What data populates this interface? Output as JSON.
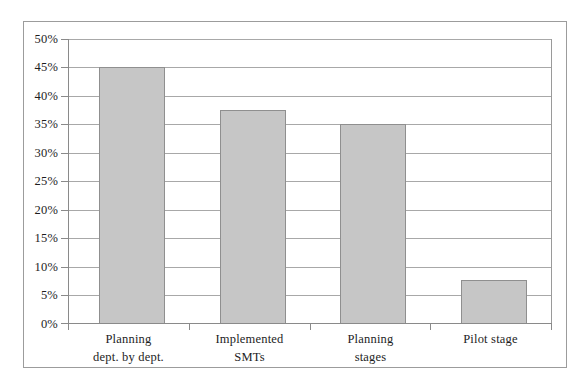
{
  "chart_data": {
    "type": "bar",
    "title": "",
    "subtitle": "",
    "xlabel": "",
    "ylabel": "",
    "categories": [
      "Planning dept. by dept.",
      "Implemented SMTs",
      "Planning stages",
      "Pilot stage"
    ],
    "category_lines": [
      [
        "Planning",
        "dept. by dept."
      ],
      [
        "Implemented",
        "SMTs"
      ],
      [
        "Planning",
        "stages"
      ],
      [
        "Pilot stage"
      ]
    ],
    "values": [
      45,
      37.5,
      35,
      7.5
    ],
    "value_labels": [
      "45%",
      "37.5%",
      "35%",
      "7.5%"
    ],
    "ylim": [
      0,
      50
    ],
    "ytick_step": 5,
    "ytick_labels": [
      "50%",
      "45%",
      "40%",
      "35%",
      "30%",
      "25%",
      "20%",
      "15%",
      "10%",
      "5%",
      "0%"
    ],
    "ytick_values": [
      50,
      45,
      40,
      35,
      30,
      25,
      20,
      15,
      10,
      5,
      0
    ],
    "grid": true,
    "grid_axis": "y",
    "legend": false,
    "legend_position": "none",
    "annotations": [],
    "colors": {
      "bar_fill": "#c6c6c6",
      "bar_border": "#8f8f8f",
      "gridline": "#a8a8a8",
      "axis": "#8a8a8a",
      "frame_border": "#9c9c9c",
      "text": "#1d1d1d",
      "background": "#ffffff"
    }
  }
}
